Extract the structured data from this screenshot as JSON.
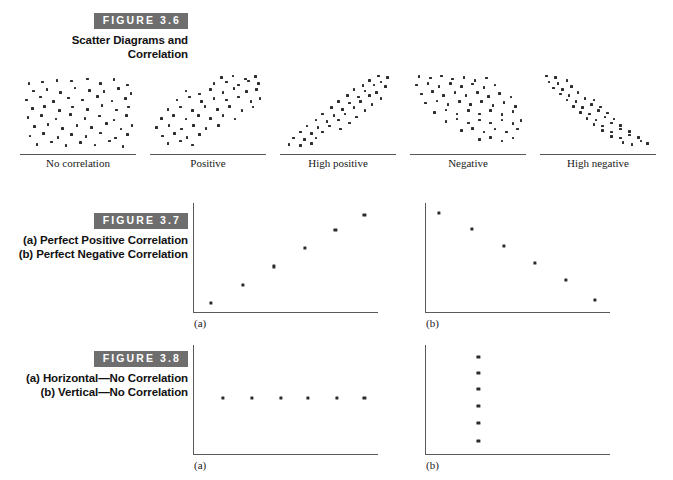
{
  "figures": [
    {
      "tag": "FIGURE 3.6",
      "title": "Scatter Diagrams and Correlation",
      "panels": [
        {
          "label": "No correlation"
        },
        {
          "label": "Positive"
        },
        {
          "label": "High positive"
        },
        {
          "label": "Negative"
        },
        {
          "label": "High negative"
        }
      ]
    },
    {
      "tag": "FIGURE 3.7",
      "title": "(a) Perfect Positive Correlation (b) Perfect Negative Correlation",
      "panels": [
        {
          "letter": "(a)"
        },
        {
          "letter": "(b)"
        }
      ]
    },
    {
      "tag": "FIGURE 3.8",
      "title": "(a) Horizontal—No Correlation (b) Vertical—No Correlation",
      "panels": [
        {
          "letter": "(a)"
        },
        {
          "letter": "(b)"
        }
      ]
    }
  ],
  "colors": {
    "tag_background": "#6e6e6e",
    "tag_text": "#ffffff",
    "dot": "#2e2e2e",
    "axis": "#5a5a5a",
    "page_background": "#ffffff"
  },
  "chart_data": [
    {
      "type": "scatter",
      "title": "No correlation",
      "figure": "FIGURE 3.6",
      "xlabel": "",
      "ylabel": "",
      "xlim": [
        0,
        100
      ],
      "ylim": [
        0,
        100
      ],
      "grid": false,
      "legend": false,
      "correlation": "none",
      "points": [
        [
          6,
          88
        ],
        [
          18,
          90
        ],
        [
          31,
          92
        ],
        [
          44,
          91
        ],
        [
          58,
          94
        ],
        [
          70,
          88
        ],
        [
          82,
          93
        ],
        [
          94,
          86
        ],
        [
          10,
          78
        ],
        [
          22,
          80
        ],
        [
          34,
          76
        ],
        [
          47,
          82
        ],
        [
          60,
          79
        ],
        [
          73,
          77
        ],
        [
          86,
          81
        ],
        [
          97,
          75
        ],
        [
          4,
          66
        ],
        [
          16,
          70
        ],
        [
          28,
          64
        ],
        [
          41,
          69
        ],
        [
          54,
          66
        ],
        [
          67,
          71
        ],
        [
          80,
          65
        ],
        [
          92,
          68
        ],
        [
          9,
          55
        ],
        [
          20,
          58
        ],
        [
          33,
          52
        ],
        [
          45,
          57
        ],
        [
          58,
          54
        ],
        [
          71,
          59
        ],
        [
          84,
          53
        ],
        [
          95,
          57
        ],
        [
          5,
          43
        ],
        [
          17,
          46
        ],
        [
          30,
          41
        ],
        [
          43,
          47
        ],
        [
          56,
          42
        ],
        [
          69,
          45
        ],
        [
          82,
          40
        ],
        [
          93,
          46
        ],
        [
          11,
          31
        ],
        [
          23,
          34
        ],
        [
          36,
          29
        ],
        [
          49,
          33
        ],
        [
          62,
          30
        ],
        [
          75,
          35
        ],
        [
          88,
          28
        ],
        [
          98,
          33
        ],
        [
          7,
          19
        ],
        [
          19,
          22
        ],
        [
          32,
          17
        ],
        [
          44,
          21
        ],
        [
          57,
          18
        ],
        [
          70,
          23
        ],
        [
          83,
          16
        ],
        [
          94,
          21
        ],
        [
          13,
          8
        ],
        [
          26,
          11
        ],
        [
          39,
          6
        ],
        [
          52,
          10
        ],
        [
          65,
          7
        ],
        [
          78,
          12
        ],
        [
          90,
          5
        ]
      ]
    },
    {
      "type": "scatter",
      "title": "Positive",
      "figure": "FIGURE 3.6",
      "xlabel": "",
      "ylabel": "",
      "xlim": [
        0,
        100
      ],
      "ylim": [
        0,
        100
      ],
      "grid": false,
      "legend": false,
      "correlation": "positive",
      "points": [
        [
          62,
          96
        ],
        [
          72,
          98
        ],
        [
          83,
          94
        ],
        [
          92,
          97
        ],
        [
          55,
          88
        ],
        [
          66,
          90
        ],
        [
          77,
          86
        ],
        [
          86,
          91
        ],
        [
          95,
          88
        ],
        [
          30,
          78
        ],
        [
          42,
          74
        ],
        [
          52,
          80
        ],
        [
          63,
          76
        ],
        [
          73,
          81
        ],
        [
          84,
          77
        ],
        [
          93,
          80
        ],
        [
          22,
          66
        ],
        [
          33,
          70
        ],
        [
          44,
          64
        ],
        [
          55,
          68
        ],
        [
          66,
          66
        ],
        [
          77,
          70
        ],
        [
          88,
          64
        ],
        [
          96,
          68
        ],
        [
          14,
          54
        ],
        [
          25,
          57
        ],
        [
          36,
          52
        ],
        [
          47,
          58
        ],
        [
          58,
          54
        ],
        [
          69,
          58
        ],
        [
          80,
          52
        ],
        [
          90,
          57
        ],
        [
          8,
          42
        ],
        [
          19,
          46
        ],
        [
          30,
          41
        ],
        [
          41,
          46
        ],
        [
          52,
          42
        ],
        [
          63,
          46
        ],
        [
          74,
          41
        ],
        [
          4,
          30
        ],
        [
          15,
          33
        ],
        [
          26,
          28
        ],
        [
          37,
          33
        ],
        [
          48,
          29
        ],
        [
          59,
          33
        ],
        [
          9,
          19
        ],
        [
          20,
          22
        ],
        [
          31,
          17
        ],
        [
          42,
          21
        ],
        [
          14,
          9
        ],
        [
          25,
          12
        ],
        [
          36,
          7
        ]
      ]
    },
    {
      "type": "scatter",
      "title": "High positive",
      "figure": "FIGURE 3.6",
      "xlabel": "",
      "ylabel": "",
      "xlim": [
        0,
        100
      ],
      "ylim": [
        0,
        100
      ],
      "grid": false,
      "legend": false,
      "correlation": "high positive",
      "points": [
        [
          86,
          98
        ],
        [
          94,
          96
        ],
        [
          78,
          92
        ],
        [
          88,
          90
        ],
        [
          72,
          85
        ],
        [
          82,
          86
        ],
        [
          92,
          84
        ],
        [
          64,
          80
        ],
        [
          74,
          78
        ],
        [
          84,
          76
        ],
        [
          58,
          72
        ],
        [
          68,
          70
        ],
        [
          78,
          72
        ],
        [
          88,
          68
        ],
        [
          50,
          64
        ],
        [
          60,
          62
        ],
        [
          70,
          64
        ],
        [
          80,
          60
        ],
        [
          44,
          56
        ],
        [
          54,
          54
        ],
        [
          64,
          56
        ],
        [
          74,
          52
        ],
        [
          36,
          48
        ],
        [
          46,
          46
        ],
        [
          56,
          48
        ],
        [
          66,
          44
        ],
        [
          30,
          40
        ],
        [
          40,
          38
        ],
        [
          50,
          40
        ],
        [
          60,
          36
        ],
        [
          22,
          32
        ],
        [
          32,
          30
        ],
        [
          42,
          32
        ],
        [
          52,
          28
        ],
        [
          16,
          24
        ],
        [
          26,
          22
        ],
        [
          36,
          24
        ],
        [
          10,
          16
        ],
        [
          20,
          14
        ],
        [
          30,
          16
        ],
        [
          6,
          8
        ],
        [
          16,
          6
        ],
        [
          26,
          9
        ]
      ]
    },
    {
      "type": "scatter",
      "title": "Negative",
      "figure": "FIGURE 3.6",
      "xlabel": "",
      "ylabel": "",
      "xlim": [
        0,
        100
      ],
      "ylim": [
        0,
        100
      ],
      "grid": false,
      "legend": false,
      "correlation": "negative",
      "points": [
        [
          6,
          97
        ],
        [
          16,
          95
        ],
        [
          26,
          98
        ],
        [
          36,
          94
        ],
        [
          46,
          96
        ],
        [
          56,
          92
        ],
        [
          66,
          95
        ],
        [
          4,
          86
        ],
        [
          14,
          88
        ],
        [
          24,
          84
        ],
        [
          34,
          88
        ],
        [
          44,
          84
        ],
        [
          54,
          87
        ],
        [
          64,
          83
        ],
        [
          74,
          86
        ],
        [
          8,
          74
        ],
        [
          18,
          77
        ],
        [
          28,
          72
        ],
        [
          38,
          76
        ],
        [
          48,
          72
        ],
        [
          58,
          76
        ],
        [
          68,
          71
        ],
        [
          78,
          75
        ],
        [
          88,
          70
        ],
        [
          12,
          62
        ],
        [
          22,
          65
        ],
        [
          32,
          60
        ],
        [
          42,
          64
        ],
        [
          52,
          60
        ],
        [
          62,
          64
        ],
        [
          72,
          59
        ],
        [
          82,
          63
        ],
        [
          92,
          58
        ],
        [
          20,
          50
        ],
        [
          30,
          53
        ],
        [
          40,
          48
        ],
        [
          50,
          52
        ],
        [
          60,
          48
        ],
        [
          70,
          52
        ],
        [
          80,
          47
        ],
        [
          90,
          51
        ],
        [
          30,
          38
        ],
        [
          40,
          41
        ],
        [
          50,
          36
        ],
        [
          60,
          40
        ],
        [
          70,
          36
        ],
        [
          80,
          40
        ],
        [
          90,
          35
        ],
        [
          97,
          39
        ],
        [
          44,
          26
        ],
        [
          54,
          29
        ],
        [
          64,
          24
        ],
        [
          74,
          28
        ],
        [
          84,
          24
        ],
        [
          94,
          28
        ],
        [
          60,
          14
        ],
        [
          70,
          17
        ],
        [
          80,
          12
        ],
        [
          90,
          16
        ]
      ]
    },
    {
      "type": "scatter",
      "title": "High negative",
      "figure": "FIGURE 3.6",
      "xlabel": "",
      "ylabel": "",
      "xlim": [
        0,
        100
      ],
      "ylim": [
        0,
        100
      ],
      "grid": false,
      "legend": false,
      "correlation": "high negative",
      "points": [
        [
          4,
          98
        ],
        [
          12,
          96
        ],
        [
          6,
          90
        ],
        [
          14,
          88
        ],
        [
          22,
          92
        ],
        [
          10,
          82
        ],
        [
          18,
          80
        ],
        [
          26,
          84
        ],
        [
          16,
          74
        ],
        [
          24,
          72
        ],
        [
          32,
          76
        ],
        [
          22,
          66
        ],
        [
          30,
          64
        ],
        [
          38,
          68
        ],
        [
          46,
          66
        ],
        [
          28,
          58
        ],
        [
          36,
          56
        ],
        [
          44,
          60
        ],
        [
          52,
          57
        ],
        [
          34,
          50
        ],
        [
          42,
          48
        ],
        [
          50,
          52
        ],
        [
          58,
          49
        ],
        [
          40,
          42
        ],
        [
          48,
          40
        ],
        [
          56,
          44
        ],
        [
          64,
          41
        ],
        [
          46,
          34
        ],
        [
          54,
          32
        ],
        [
          62,
          36
        ],
        [
          70,
          33
        ],
        [
          54,
          26
        ],
        [
          62,
          24
        ],
        [
          70,
          28
        ],
        [
          78,
          25
        ],
        [
          62,
          18
        ],
        [
          70,
          16
        ],
        [
          78,
          20
        ],
        [
          86,
          17
        ],
        [
          72,
          10
        ],
        [
          80,
          8
        ],
        [
          88,
          12
        ],
        [
          94,
          9
        ]
      ]
    },
    {
      "type": "scatter",
      "title": "(a) Perfect Positive Correlation",
      "figure": "FIGURE 3.7",
      "xlabel": "",
      "ylabel": "",
      "xlim": [
        0,
        100
      ],
      "ylim": [
        0,
        100
      ],
      "grid": false,
      "legend": false,
      "correlation": "perfect positive",
      "points": [
        [
          5,
          3
        ],
        [
          24,
          22
        ],
        [
          42,
          41
        ],
        [
          60,
          60
        ],
        [
          78,
          79
        ],
        [
          95,
          95
        ]
      ]
    },
    {
      "type": "scatter",
      "title": "(b) Perfect Negative Correlation",
      "figure": "FIGURE 3.7",
      "xlabel": "",
      "ylabel": "",
      "xlim": [
        0,
        100
      ],
      "ylim": [
        0,
        100
      ],
      "grid": false,
      "legend": false,
      "correlation": "perfect negative",
      "points": [
        [
          3,
          97
        ],
        [
          22,
          80
        ],
        [
          41,
          62
        ],
        [
          59,
          45
        ],
        [
          77,
          27
        ],
        [
          94,
          6
        ]
      ]
    },
    {
      "type": "scatter",
      "title": "(a) Horizontal—No Correlation",
      "figure": "FIGURE 3.8",
      "xlabel": "",
      "ylabel": "",
      "xlim": [
        0,
        100
      ],
      "ylim": [
        0,
        100
      ],
      "grid": false,
      "legend": false,
      "correlation": "none (horizontal)",
      "points": [
        [
          12,
          52
        ],
        [
          29,
          52
        ],
        [
          46,
          52
        ],
        [
          62,
          52
        ],
        [
          79,
          52
        ],
        [
          95,
          52
        ]
      ]
    },
    {
      "type": "scatter",
      "title": "(b) Vertical—No Correlation",
      "figure": "FIGURE 3.8",
      "xlabel": "",
      "ylabel": "",
      "xlim": [
        0,
        100
      ],
      "ylim": [
        0,
        100
      ],
      "grid": false,
      "legend": false,
      "correlation": "none (vertical)",
      "points": [
        [
          26,
          95
        ],
        [
          26,
          78
        ],
        [
          26,
          61
        ],
        [
          26,
          44
        ],
        [
          26,
          26
        ],
        [
          26,
          7
        ]
      ]
    }
  ]
}
